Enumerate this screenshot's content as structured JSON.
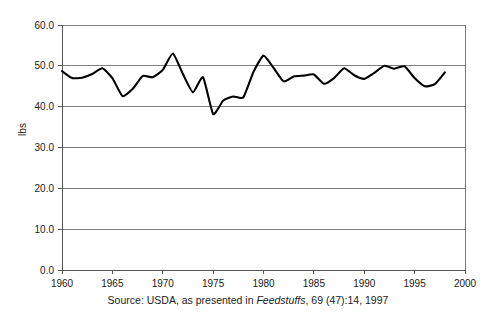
{
  "chart_data": {
    "type": "line",
    "title": "",
    "xlabel": "",
    "ylabel": "lbs",
    "xlim": [
      1960,
      2000
    ],
    "ylim": [
      0,
      60
    ],
    "grid": true,
    "legend": null,
    "ytick_labels": [
      "60.0",
      "50.0",
      "40.0",
      "30.0",
      "20.0",
      "10.0",
      "0.0"
    ],
    "ytick_values": [
      60,
      50,
      40,
      30,
      20,
      10,
      0
    ],
    "xtick_labels": [
      "1960",
      "1965",
      "1970",
      "1975",
      "1980",
      "1985",
      "1990",
      "1995",
      "2000"
    ],
    "xtick_values": [
      1960,
      1965,
      1970,
      1975,
      1980,
      1985,
      1990,
      1995,
      2000
    ],
    "series": [
      {
        "name": "lbs",
        "color": "#000000",
        "x": [
          1960,
          1961,
          1962,
          1963,
          1964,
          1965,
          1966,
          1967,
          1968,
          1969,
          1970,
          1971,
          1972,
          1973,
          1974,
          1975,
          1976,
          1977,
          1978,
          1979,
          1980,
          1981,
          1982,
          1983,
          1984,
          1985,
          1986,
          1987,
          1988,
          1989,
          1990,
          1991,
          1992,
          1993,
          1994,
          1995,
          1996,
          1997,
          1998
        ],
        "values": [
          48.7,
          47.0,
          47.1,
          48.0,
          49.4,
          47.0,
          42.6,
          44.3,
          47.5,
          47.2,
          49.0,
          53.0,
          48.0,
          43.5,
          47.2,
          38.2,
          41.5,
          42.5,
          42.3,
          48.5,
          52.5,
          49.5,
          46.2,
          47.4,
          47.6,
          47.9,
          45.6,
          47.0,
          49.4,
          47.7,
          46.8,
          48.3,
          50.0,
          49.3,
          49.9,
          47.0,
          45.0,
          45.5,
          48.4
        ]
      }
    ]
  },
  "caption": {
    "prefix": "Source: USDA, as presented in ",
    "italic": "Feedstuffs",
    "suffix": ", 69 (47):14, 1997"
  },
  "colors": {
    "line": "#000000",
    "grid": "#808080",
    "frame": "#7a7a7a",
    "text": "#1a1a1a",
    "background": "#ffffff"
  }
}
